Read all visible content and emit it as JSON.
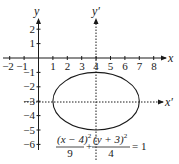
{
  "diagram": {
    "type": "ellipse-translation",
    "axes": {
      "x_label": "x",
      "y_label": "y",
      "x_prime_label": "x′",
      "y_prime_label": "y′"
    },
    "x_ticks": [
      {
        "value": -2,
        "label": "−2"
      },
      {
        "value": -1,
        "label": "−1"
      },
      {
        "value": 1,
        "label": "1"
      },
      {
        "value": 2,
        "label": "2"
      },
      {
        "value": 3,
        "label": "3"
      },
      {
        "value": 4,
        "label": "4"
      },
      {
        "value": 5,
        "label": "5"
      },
      {
        "value": 6,
        "label": "6"
      },
      {
        "value": 7,
        "label": "7"
      },
      {
        "value": 8,
        "label": "8"
      }
    ],
    "y_ticks": [
      {
        "value": 2,
        "label": "2"
      },
      {
        "value": 1,
        "label": "1"
      },
      {
        "value": -1,
        "label": "−1"
      },
      {
        "value": -2,
        "label": "−2"
      },
      {
        "value": -3,
        "label": "−3"
      },
      {
        "value": -4,
        "label": "−4"
      },
      {
        "value": -5,
        "label": "−5"
      },
      {
        "value": -6,
        "label": "−6"
      }
    ],
    "ellipse": {
      "center": [
        4,
        -3
      ],
      "semi_major_x": 3,
      "semi_minor_y": 2
    },
    "translated_origin": [
      4,
      -3
    ],
    "equation": {
      "term1_numerator": "(x − 4)",
      "term1_exponent": "2",
      "term1_denominator": "9",
      "plus": "+",
      "term2_numerator": "(y + 3)",
      "term2_exponent": "2",
      "term2_denominator": "4",
      "equals": "= 1"
    },
    "colors": {
      "stroke": "#1a1a1a",
      "background": "#ffffff"
    }
  }
}
